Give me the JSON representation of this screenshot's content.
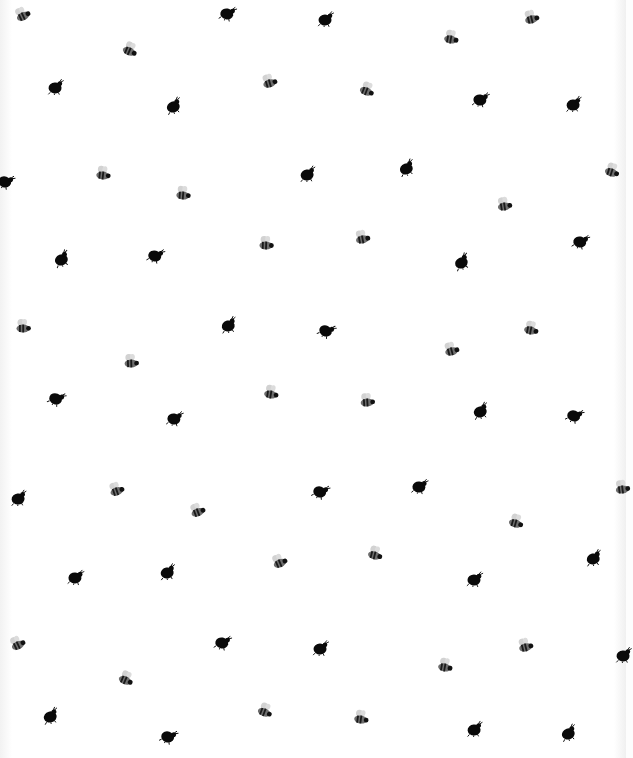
{
  "image": {
    "description": "White fabric with scattered black ladybugs and grey striped bees",
    "background": "#fdfdfd",
    "ladybug_color": "#0a0a0a",
    "bee_body_color": "#3a3a3a",
    "bee_wing_color": "#cfcfcf"
  },
  "motifs": [
    {
      "type": "bee",
      "x": 22,
      "y": 14
    },
    {
      "type": "ladybug",
      "x": 227,
      "y": 13
    },
    {
      "type": "ladybug",
      "x": 325,
      "y": 19
    },
    {
      "type": "bee",
      "x": 531,
      "y": 17
    },
    {
      "type": "bee",
      "x": 130,
      "y": 49
    },
    {
      "type": "bee",
      "x": 451,
      "y": 37
    },
    {
      "type": "ladybug",
      "x": 55,
      "y": 87
    },
    {
      "type": "bee",
      "x": 269,
      "y": 81
    },
    {
      "type": "bee",
      "x": 367,
      "y": 89
    },
    {
      "type": "ladybug",
      "x": 480,
      "y": 99
    },
    {
      "type": "ladybug",
      "x": 573,
      "y": 104
    },
    {
      "type": "ladybug",
      "x": 173,
      "y": 106
    },
    {
      "type": "ladybug",
      "x": 5,
      "y": 181
    },
    {
      "type": "bee",
      "x": 103,
      "y": 173
    },
    {
      "type": "ladybug",
      "x": 307,
      "y": 174
    },
    {
      "type": "ladybug",
      "x": 406,
      "y": 168
    },
    {
      "type": "bee",
      "x": 612,
      "y": 170
    },
    {
      "type": "bee",
      "x": 183,
      "y": 193
    },
    {
      "type": "bee",
      "x": 504,
      "y": 204
    },
    {
      "type": "ladybug",
      "x": 61,
      "y": 259
    },
    {
      "type": "ladybug",
      "x": 155,
      "y": 255
    },
    {
      "type": "bee",
      "x": 266,
      "y": 243
    },
    {
      "type": "bee",
      "x": 362,
      "y": 237
    },
    {
      "type": "ladybug",
      "x": 461,
      "y": 262
    },
    {
      "type": "ladybug",
      "x": 580,
      "y": 241
    },
    {
      "type": "bee",
      "x": 23,
      "y": 326
    },
    {
      "type": "ladybug",
      "x": 228,
      "y": 325
    },
    {
      "type": "ladybug",
      "x": 326,
      "y": 330
    },
    {
      "type": "bee",
      "x": 531,
      "y": 328
    },
    {
      "type": "bee",
      "x": 131,
      "y": 361
    },
    {
      "type": "bee",
      "x": 451,
      "y": 349
    },
    {
      "type": "ladybug",
      "x": 56,
      "y": 398
    },
    {
      "type": "bee",
      "x": 271,
      "y": 392
    },
    {
      "type": "bee",
      "x": 367,
      "y": 400
    },
    {
      "type": "ladybug",
      "x": 480,
      "y": 411
    },
    {
      "type": "ladybug",
      "x": 574,
      "y": 415
    },
    {
      "type": "ladybug",
      "x": 174,
      "y": 418
    },
    {
      "type": "ladybug",
      "x": 18,
      "y": 498
    },
    {
      "type": "bee",
      "x": 116,
      "y": 489
    },
    {
      "type": "ladybug",
      "x": 320,
      "y": 491
    },
    {
      "type": "ladybug",
      "x": 419,
      "y": 486
    },
    {
      "type": "bee",
      "x": 622,
      "y": 487
    },
    {
      "type": "bee",
      "x": 197,
      "y": 510
    },
    {
      "type": "bee",
      "x": 516,
      "y": 521
    },
    {
      "type": "ladybug",
      "x": 75,
      "y": 577
    },
    {
      "type": "ladybug",
      "x": 167,
      "y": 572
    },
    {
      "type": "bee",
      "x": 279,
      "y": 561
    },
    {
      "type": "bee",
      "x": 375,
      "y": 553
    },
    {
      "type": "ladybug",
      "x": 474,
      "y": 579
    },
    {
      "type": "ladybug",
      "x": 593,
      "y": 558
    },
    {
      "type": "bee",
      "x": 17,
      "y": 643
    },
    {
      "type": "ladybug",
      "x": 222,
      "y": 642
    },
    {
      "type": "ladybug",
      "x": 320,
      "y": 648
    },
    {
      "type": "bee",
      "x": 525,
      "y": 645
    },
    {
      "type": "bee",
      "x": 126,
      "y": 678
    },
    {
      "type": "bee",
      "x": 445,
      "y": 665
    },
    {
      "type": "ladybug",
      "x": 623,
      "y": 655
    },
    {
      "type": "ladybug",
      "x": 50,
      "y": 716
    },
    {
      "type": "bee",
      "x": 265,
      "y": 710
    },
    {
      "type": "bee",
      "x": 361,
      "y": 717
    },
    {
      "type": "ladybug",
      "x": 474,
      "y": 729
    },
    {
      "type": "ladybug",
      "x": 568,
      "y": 733
    },
    {
      "type": "ladybug",
      "x": 168,
      "y": 736
    }
  ]
}
